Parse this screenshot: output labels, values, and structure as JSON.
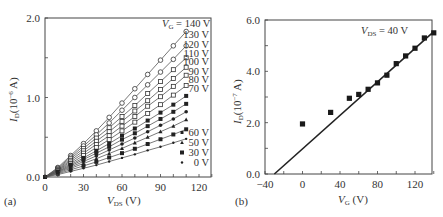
{
  "chart_data": [
    {
      "panel": "(a)",
      "type": "line",
      "xlabel": "V_DS (V)",
      "ylabel": "I_D (10^-6 A)",
      "xlim": [
        0,
        130
      ],
      "ylim": [
        0,
        2.0
      ],
      "xticks": [
        0,
        30,
        60,
        90,
        120
      ],
      "yticks": [
        0.0,
        1.0,
        2.0
      ],
      "grid": false,
      "x": [
        0,
        10,
        20,
        30,
        40,
        50,
        60,
        70,
        80,
        90,
        100,
        110
      ],
      "series": [
        {
          "name": "V_G = 140 V",
          "marker": "open-circle",
          "values": [
            0,
            0.12,
            0.27,
            0.42,
            0.58,
            0.75,
            0.93,
            1.11,
            1.29,
            1.47,
            1.65,
            1.83
          ]
        },
        {
          "name": "130 V",
          "marker": "open-circle",
          "values": [
            0,
            0.11,
            0.25,
            0.39,
            0.53,
            0.68,
            0.84,
            1.0,
            1.16,
            1.32,
            1.48,
            1.65
          ]
        },
        {
          "name": "120 V",
          "marker": "open-square",
          "values": [
            0,
            0.1,
            0.23,
            0.36,
            0.49,
            0.62,
            0.76,
            0.9,
            1.05,
            1.2,
            1.35,
            1.5
          ]
        },
        {
          "name": "110 V",
          "marker": "open-square",
          "values": [
            0,
            0.09,
            0.21,
            0.33,
            0.45,
            0.57,
            0.7,
            0.83,
            0.96,
            1.1,
            1.24,
            1.38
          ]
        },
        {
          "name": "100 V",
          "marker": "open-square",
          "values": [
            0,
            0.085,
            0.19,
            0.3,
            0.41,
            0.52,
            0.64,
            0.76,
            0.89,
            1.01,
            1.14,
            1.28
          ]
        },
        {
          "name": "90 V",
          "marker": "open-square",
          "values": [
            0,
            0.08,
            0.17,
            0.27,
            0.37,
            0.47,
            0.58,
            0.69,
            0.8,
            0.91,
            1.03,
            1.15
          ]
        },
        {
          "name": "80 V",
          "marker": "filled-square",
          "values": [
            0,
            0.07,
            0.155,
            0.24,
            0.33,
            0.42,
            0.52,
            0.61,
            0.71,
            0.81,
            0.91,
            1.02
          ]
        },
        {
          "name": "70 V",
          "marker": "filled-square",
          "values": [
            0,
            0.065,
            0.14,
            0.22,
            0.3,
            0.38,
            0.47,
            0.55,
            0.64,
            0.73,
            0.82,
            0.92
          ]
        },
        {
          "name": "60 V",
          "marker": "filled-circle",
          "values": [
            0,
            0.06,
            0.125,
            0.195,
            0.265,
            0.34,
            0.415,
            0.49,
            0.57,
            0.65,
            0.73,
            0.82
          ]
        },
        {
          "name": "50 V",
          "marker": "filled-triangle",
          "values": [
            0,
            0.05,
            0.11,
            0.17,
            0.23,
            0.295,
            0.36,
            0.43,
            0.5,
            0.57,
            0.64,
            0.72
          ]
        },
        {
          "name": "30 V",
          "marker": "filled-square",
          "values": [
            0,
            0.04,
            0.09,
            0.14,
            0.19,
            0.245,
            0.3,
            0.355,
            0.415,
            0.475,
            0.535,
            0.6
          ]
        },
        {
          "name": "0 V",
          "marker": "filled-dot",
          "values": [
            0,
            0.03,
            0.07,
            0.11,
            0.15,
            0.195,
            0.24,
            0.285,
            0.335,
            0.38,
            0.43,
            0.48
          ]
        }
      ],
      "annotations": [
        "V_G = 140 V",
        "130 V",
        "120 V",
        "110 V",
        "100 V",
        "90 V",
        "80 V",
        "70 V"
      ],
      "legend": {
        "position": "lower right",
        "entries": [
          "60 V",
          "50 V",
          "30 V",
          "0 V"
        ]
      }
    },
    {
      "panel": "(b)",
      "type": "scatter",
      "xlabel": "V_G (V)",
      "ylabel": "I_D (10^-7 A)",
      "xlim": [
        -40,
        140
      ],
      "ylim": [
        0,
        6.0
      ],
      "xticks": [
        -40,
        0,
        40,
        80,
        120
      ],
      "yticks": [
        0.0,
        2.0,
        4.0,
        6.0
      ],
      "grid": false,
      "annotation": "V_DS = 40 V",
      "points": {
        "x": [
          0,
          30,
          50,
          60,
          70,
          80,
          90,
          100,
          110,
          120,
          130,
          140
        ],
        "y": [
          1.95,
          2.4,
          2.95,
          3.1,
          3.3,
          3.55,
          3.85,
          4.3,
          4.6,
          4.9,
          5.3,
          5.5
        ]
      },
      "fit_line": {
        "x": [
          -30,
          140
        ],
        "y": [
          0.0,
          5.55
        ]
      }
    }
  ],
  "labels": {
    "a": {
      "panel": "(a)",
      "x_axis_var": "V",
      "x_axis_sub": "DS",
      "x_axis_unit": " (V)",
      "y_axis_var": "I",
      "y_axis_sub": "D",
      "y_axis_unit": "(10",
      "y_axis_exp": "−6",
      "y_axis_end": " A)",
      "xticks": [
        "0",
        "30",
        "60",
        "90",
        "120"
      ],
      "yticks": [
        "0.0",
        "1.0",
        "2.0"
      ],
      "vg_top_var": "V",
      "vg_top_sub": "G",
      "vg_top_val": " = 140 V",
      "curve_labels": [
        "130 V",
        "120 V",
        "110 V",
        "100 V",
        "90 V",
        "80 V",
        "70 V"
      ],
      "legend": [
        "60 V",
        "50 V",
        "30 V",
        "0 V"
      ]
    },
    "b": {
      "panel": "(b)",
      "x_axis_var": "V",
      "x_axis_sub": "G",
      "x_axis_unit": " (V)",
      "y_axis_var": "I",
      "y_axis_sub": "D",
      "y_axis_unit": "(10",
      "y_axis_exp": "−7",
      "y_axis_end": " A)",
      "xticks": [
        "−40",
        "0",
        "40",
        "80",
        "120"
      ],
      "yticks": [
        "0.0",
        "2.0",
        "4.0",
        "6.0"
      ],
      "vds_var": "V",
      "vds_sub": "DS",
      "vds_val": " = 40 V"
    }
  }
}
